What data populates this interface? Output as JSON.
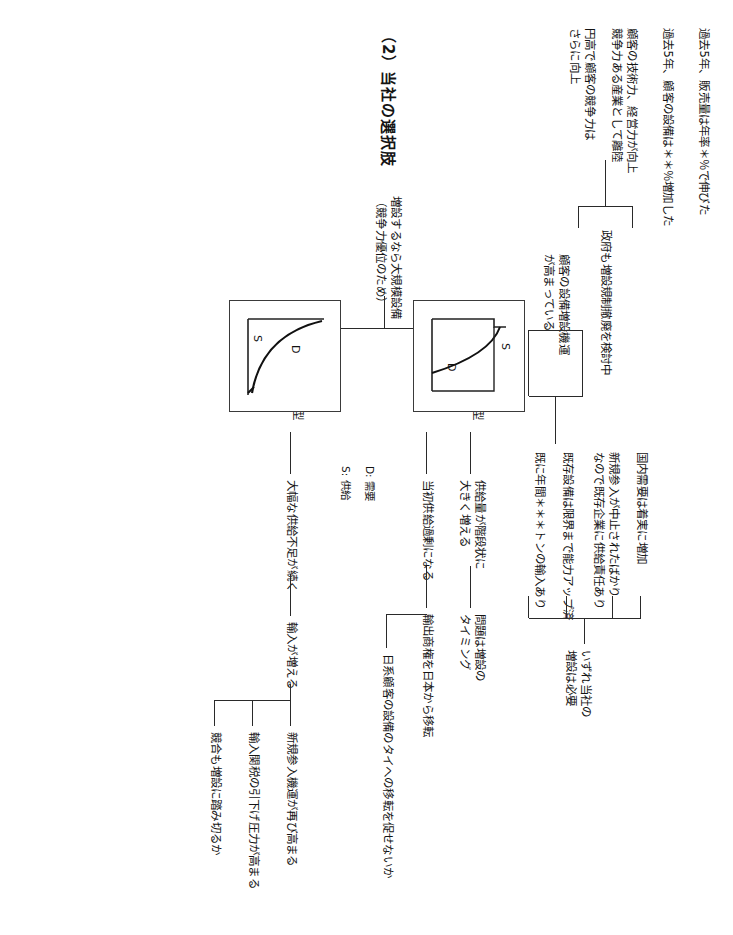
{
  "document": {
    "orientation": "rotated-90-clockwise",
    "language": "ja",
    "section_title": "（2）当社の選択肢"
  },
  "premises": {
    "items": [
      {
        "id": "p1",
        "text": "過去5年、販売量は年率＊％で伸びた"
      },
      {
        "id": "p2",
        "text": "過去5年、顧客の設備は＊＊％増加した"
      },
      {
        "id": "p3",
        "text": "顧客の技術力、経営力が向上\n競争力ある産業として離陸"
      },
      {
        "id": "p4",
        "text": "円高で顧客の競争力は\nさらに向上"
      },
      {
        "id": "p5",
        "text": "政府も増設規制撤廃を検討中"
      }
    ]
  },
  "demand_chain": {
    "node_a": "顧客の設備増設機運\nが高まっている",
    "node_b": "国内需要は着実に増加",
    "node_c": "新規参入が中止されたばかり\nなので既存企業に供給責任あり",
    "node_d": "既存設備は限界まで能力アップ済",
    "node_e": "既に年間＊＊＊トンの輸入あり",
    "node_f": "いずれ当社の\n増設は必要"
  },
  "options": {
    "heading": "増設するなら大規模設備\n（競争力優位のため）",
    "supply_first": {
      "label": "供給先行型",
      "consequence_1": "供給量が階段状に\n大きく増える",
      "consequence_2": "当初供給過剰になる",
      "consequence_3": "問題は増設の\nタイミング",
      "consequence_4": "輸出商権を日本から移転",
      "consequence_5": "日系顧客の設備のタイへの移転を促せないか"
    },
    "demand_first": {
      "label": "需要先行型",
      "consequence_1": "大幅な供給不足が続く",
      "consequence_2": "輸入が増える",
      "consequence_3": "新規参入機運が再び高まる",
      "consequence_4": "輸入関税の引下げ圧力が高まる",
      "consequence_5": "競合も増設に踏み切るか"
    },
    "timing_node": "問題は増設の\nタイミング"
  },
  "charts": {
    "legend": [
      {
        "key": "D",
        "label": "D: 需要"
      },
      {
        "key": "S",
        "label": "S: 供給"
      }
    ],
    "supply_first_chart": {
      "caption": "供給先行型",
      "series_labels": {
        "supply": "S",
        "demand": "D"
      }
    },
    "demand_first_chart": {
      "caption": "需要先行型",
      "series_labels": {
        "supply": "S",
        "demand": "D"
      }
    }
  }
}
